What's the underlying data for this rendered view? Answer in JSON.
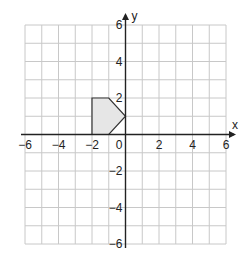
{
  "chart_data": {
    "type": "scatter",
    "title": "",
    "xlabel": "x",
    "ylabel": "y",
    "xlim": [
      -6,
      6
    ],
    "ylim": [
      -6,
      6
    ],
    "grid": true,
    "grid_step": 1,
    "x_ticks": [
      -6,
      -4,
      -2,
      2,
      4,
      6
    ],
    "y_ticks": [
      6,
      4,
      2,
      -2,
      -4,
      -6
    ],
    "x_tick_labels": [
      "−6",
      "−4",
      "−2",
      "2",
      "4",
      "6"
    ],
    "y_tick_labels": [
      "6",
      "4",
      "2",
      "−2",
      "−4",
      "−6"
    ],
    "origin_label": "0",
    "shapes": [
      {
        "name": "shaded-pentagon",
        "fill": "#e6e6e6",
        "stroke": "#333333",
        "vertices": [
          [
            -2,
            0
          ],
          [
            -2,
            2
          ],
          [
            -1,
            2
          ],
          [
            0,
            1
          ],
          [
            -1,
            0
          ]
        ]
      }
    ]
  }
}
